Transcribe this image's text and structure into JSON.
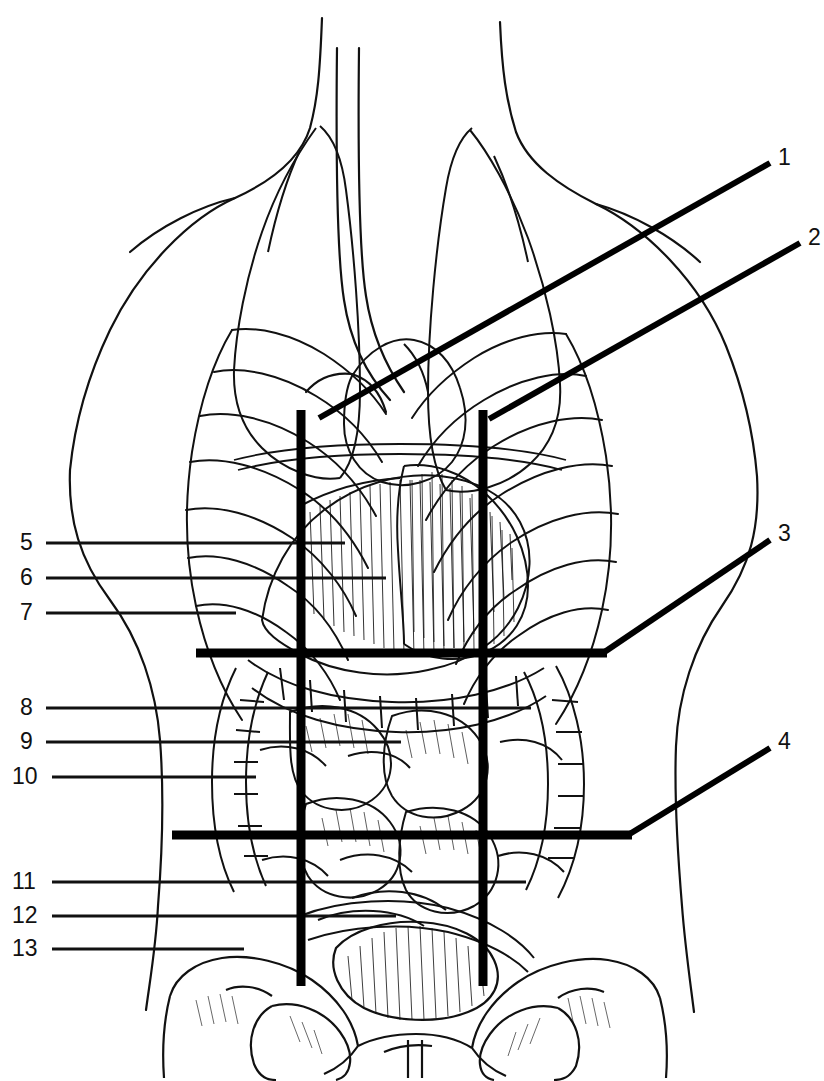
{
  "figure": {
    "background_color": "#ffffff",
    "ink_color": "#111111",
    "grid_color": "#000000",
    "width": 824,
    "height": 1081
  },
  "grid": {
    "name": "nine-region-abdominal-grid",
    "vertical_lines": [
      {
        "id": "left-midclavicular-line",
        "x": 301,
        "y1": 410,
        "y2": 986,
        "stroke": 9
      },
      {
        "id": "right-midclavicular-line",
        "x": 483,
        "y1": 410,
        "y2": 986,
        "stroke": 9
      }
    ],
    "horizontal_lines": [
      {
        "id": "subcostal-plane",
        "y": 653,
        "x1": 196,
        "x2": 607,
        "stroke": 9
      },
      {
        "id": "intertubercular-plane",
        "y": 835,
        "x1": 172,
        "x2": 632,
        "stroke": 9
      }
    ]
  },
  "labels_left": [
    {
      "number": "5",
      "x": 22,
      "y": 543,
      "line_x1": 46,
      "line_x2": 345
    },
    {
      "number": "6",
      "x": 22,
      "y": 578,
      "line_x1": 46,
      "line_x2": 386
    },
    {
      "number": "7",
      "x": 22,
      "y": 613,
      "line_x1": 46,
      "line_x2": 236
    },
    {
      "number": "8",
      "x": 22,
      "y": 708,
      "line_x1": 46,
      "line_x2": 531
    },
    {
      "number": "9",
      "x": 22,
      "y": 742,
      "line_x1": 46,
      "line_x2": 401
    },
    {
      "number": "10",
      "x": 14,
      "y": 777,
      "line_x1": 52,
      "line_x2": 256
    },
    {
      "number": "11",
      "x": 14,
      "y": 882,
      "line_x1": 52,
      "line_x2": 526
    },
    {
      "number": "12",
      "x": 14,
      "y": 916,
      "line_x1": 52,
      "line_x2": 396
    },
    {
      "number": "13",
      "x": 14,
      "y": 949,
      "line_x1": 52,
      "line_x2": 244
    }
  ],
  "labels_right": [
    {
      "number": "1",
      "x": 780,
      "y": 158,
      "line": {
        "x1": 770,
        "y1": 163,
        "x2": 319,
        "y2": 418
      }
    },
    {
      "number": "2",
      "x": 810,
      "y": 238,
      "line": {
        "x1": 800,
        "y1": 243,
        "x2": 489,
        "y2": 419
      }
    },
    {
      "number": "3",
      "x": 780,
      "y": 534,
      "line": {
        "x1": 770,
        "y1": 540,
        "x2": 603,
        "y2": 653
      }
    },
    {
      "number": "4",
      "x": 780,
      "y": 742,
      "line": {
        "x1": 770,
        "y1": 748,
        "x2": 628,
        "y2": 835
      }
    }
  ],
  "anatomy_parts": [
    {
      "name": "neck-and-shoulders-outline"
    },
    {
      "name": "left-lung-outline"
    },
    {
      "name": "right-lung-outline"
    },
    {
      "name": "trachea-outline"
    },
    {
      "name": "heart-outline"
    },
    {
      "name": "diaphragm-outline"
    },
    {
      "name": "rib-cage-left"
    },
    {
      "name": "rib-cage-right"
    },
    {
      "name": "costal-cartilages"
    },
    {
      "name": "liver"
    },
    {
      "name": "stomach"
    },
    {
      "name": "greater-omentum"
    },
    {
      "name": "transverse-colon"
    },
    {
      "name": "ascending-colon"
    },
    {
      "name": "descending-colon"
    },
    {
      "name": "small-intestine-coils"
    },
    {
      "name": "sigmoid-colon"
    },
    {
      "name": "urinary-bladder"
    },
    {
      "name": "pelvis-ilium-left"
    },
    {
      "name": "pelvis-ilium-right"
    },
    {
      "name": "sacrum"
    },
    {
      "name": "pubic-symphysis"
    },
    {
      "name": "obturator-foramen-left"
    },
    {
      "name": "obturator-foramen-right"
    },
    {
      "name": "torso-outline-left"
    },
    {
      "name": "torso-outline-right"
    }
  ]
}
